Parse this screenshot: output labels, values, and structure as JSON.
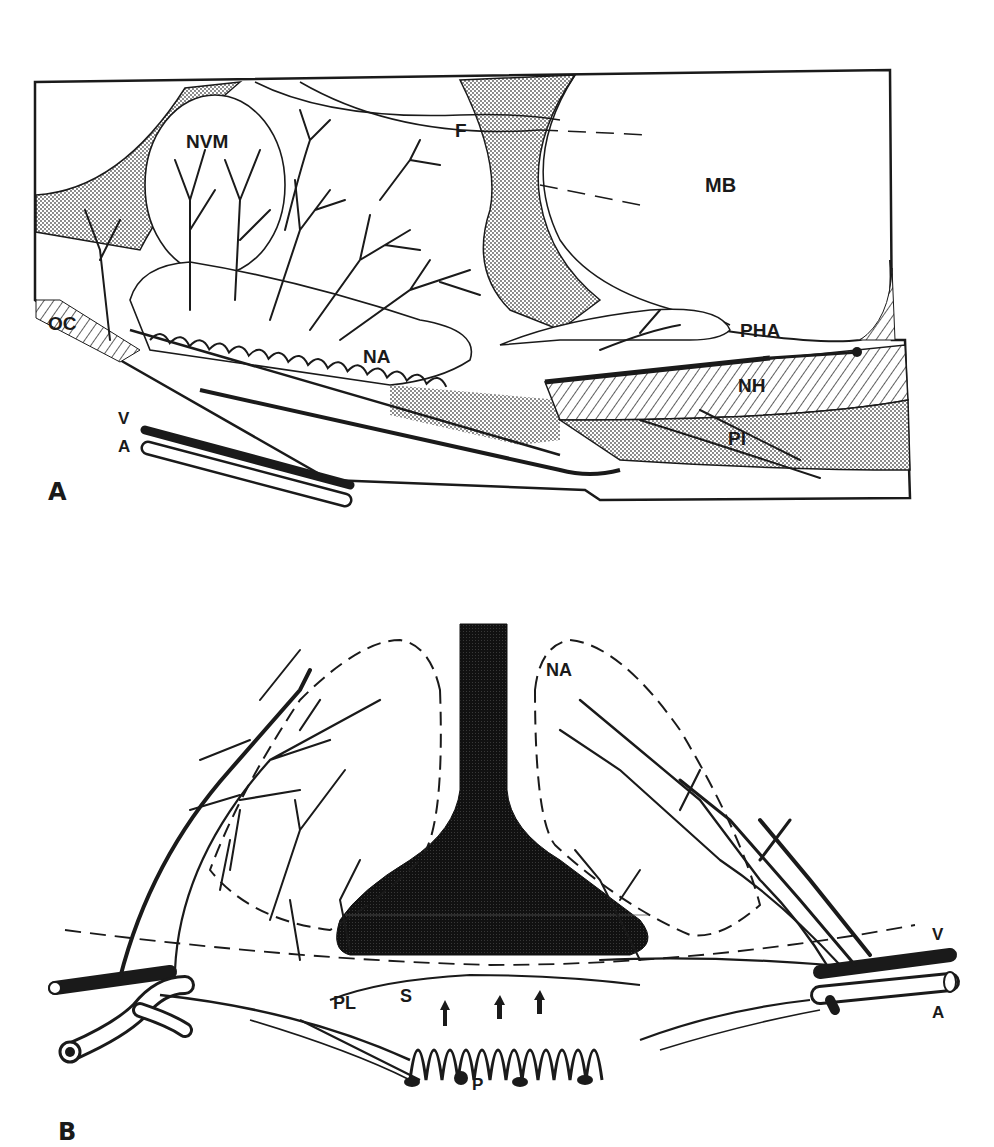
{
  "figure": {
    "panels": [
      {
        "id": "A",
        "letter": "A",
        "view": "sagittal",
        "labels": {
          "NVM": "NVM",
          "F": "F",
          "MB": "MB",
          "OC": "OC",
          "NA": "NA",
          "PHA": "PHA",
          "NH": "NH",
          "PI": "PI",
          "V": "V",
          "A": "A"
        }
      },
      {
        "id": "B",
        "letter": "B",
        "view": "transverse",
        "labels": {
          "NA": "NA",
          "PL": "PL",
          "S": "S",
          "P": "P",
          "V": "V",
          "A": "A"
        }
      }
    ],
    "colors": {
      "ink": "#1a1a1a",
      "stipple": "#bdbdbd",
      "background": "#ffffff"
    }
  }
}
